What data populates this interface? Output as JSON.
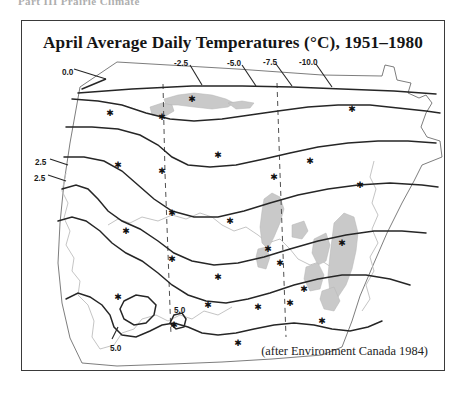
{
  "page": {
    "running_head": "Part III  Prairie Climate"
  },
  "figure": {
    "title": "April Average Daily Temperatures (°C), 1951–1980",
    "credit": "(after Environment Canada 1984)",
    "frame_color": "#3a3a3a",
    "background_color": "#ffffff"
  },
  "chart_data": {
    "type": "map",
    "title": "April Average Daily Temperatures (°C), 1951–1980",
    "subtitle": "",
    "xlabel": "",
    "ylabel": "",
    "units": "°C",
    "variable": "April average daily temperature",
    "period": "1951–1980",
    "region": "Western Canada (British Columbia, Alberta, Saskatchewan, Manitoba)",
    "source": "Environment Canada 1984",
    "contour_interval": 2.5,
    "legend": "none",
    "grid": false,
    "isotherm_labels": [
      {
        "value": 0.0,
        "text": "0.0",
        "x": 40,
        "y": 14,
        "leader_to": [
          84,
          26
        ]
      },
      {
        "value": -2.5,
        "text": "-2.5",
        "x": 152,
        "y": 5,
        "leader_to": [
          168,
          32
        ]
      },
      {
        "value": -5.0,
        "text": "-5.0",
        "x": 205,
        "y": 5,
        "leader_to": [
          228,
          33
        ]
      },
      {
        "value": -7.5,
        "text": "-7.5",
        "x": 241,
        "y": 4,
        "leader_to": [
          264,
          33
        ]
      },
      {
        "value": -10.0,
        "text": "-10.0",
        "x": 277,
        "y": 4,
        "leader_to": [
          300,
          34
        ]
      },
      {
        "value": 2.5,
        "text": "2.5",
        "x": 13,
        "y": 104,
        "leader_to": [
          48,
          112
        ]
      },
      {
        "value": 2.5,
        "text": "2.5",
        "x": 12,
        "y": 120,
        "leader_to": [
          44,
          128
        ]
      },
      {
        "value": 5.0,
        "text": "5.0",
        "x": 152,
        "y": 252,
        "leader_to": [
          152,
          262
        ]
      },
      {
        "value": 5.0,
        "text": "5.0",
        "x": 88,
        "y": 290,
        "leader_to": [
          92,
          280
        ]
      }
    ],
    "isotherm_values": [
      0.0,
      -2.5,
      -5.0,
      -7.5,
      -10.0,
      2.5,
      5.0
    ],
    "feature_layers": [
      {
        "name": "isotherms",
        "style": "solid dark line",
        "color": "#262626"
      },
      {
        "name": "provincial-borders",
        "style": "dashed",
        "color": "#4a4a4a"
      },
      {
        "name": "coastline-and-rivers",
        "style": "thin light line",
        "color": "#b8b8b8"
      },
      {
        "name": "lakes",
        "style": "filled",
        "color": "#c9c9c9"
      },
      {
        "name": "weather-stations",
        "style": "asterisk marker",
        "color": "#111111"
      }
    ],
    "station_count": 26
  }
}
